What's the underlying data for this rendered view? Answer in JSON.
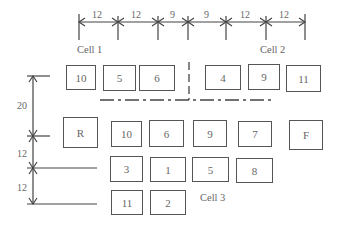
{
  "top_dimensions": {
    "ticks_x": [
      79,
      118,
      158,
      188,
      226,
      266,
      305
    ],
    "labels": [
      {
        "text": "12",
        "x": 92
      },
      {
        "text": "12",
        "x": 131
      },
      {
        "text": "9",
        "x": 170
      },
      {
        "text": "9",
        "x": 204
      },
      {
        "text": "12",
        "x": 240
      },
      {
        "text": "12",
        "x": 279
      }
    ]
  },
  "left_dimensions": {
    "ticks_y": [
      76,
      136,
      168,
      204
    ],
    "labels": [
      {
        "text": "20",
        "y": 100
      },
      {
        "text": "12",
        "y": 148
      },
      {
        "text": "12",
        "y": 182
      }
    ]
  },
  "cell_labels": {
    "cell1": "Cell 1",
    "cell2": "Cell 2",
    "cell3": "Cell 3"
  },
  "rows": {
    "row1": [
      {
        "label": "10",
        "x": 66,
        "y": 65,
        "w": 30,
        "h": 25
      },
      {
        "label": "5",
        "x": 103,
        "y": 65,
        "w": 33,
        "h": 26
      },
      {
        "label": "6",
        "x": 139,
        "y": 65,
        "w": 36,
        "h": 26
      },
      {
        "label": "4",
        "x": 205,
        "y": 65,
        "w": 36,
        "h": 25
      },
      {
        "label": "9",
        "x": 248,
        "y": 64,
        "w": 32,
        "h": 26
      },
      {
        "label": "11",
        "x": 286,
        "y": 65,
        "w": 35,
        "h": 27
      }
    ],
    "row2": [
      {
        "label": "R",
        "x": 63,
        "y": 117,
        "w": 35,
        "h": 31
      },
      {
        "label": "10",
        "x": 111,
        "y": 121,
        "w": 31,
        "h": 26
      },
      {
        "label": "6",
        "x": 149,
        "y": 120,
        "w": 35,
        "h": 27
      },
      {
        "label": "9",
        "x": 193,
        "y": 120,
        "w": 34,
        "h": 27
      },
      {
        "label": "7",
        "x": 238,
        "y": 121,
        "w": 34,
        "h": 26
      },
      {
        "label": "F",
        "x": 289,
        "y": 120,
        "w": 34,
        "h": 30
      }
    ],
    "row3": [
      {
        "label": "3",
        "x": 110,
        "y": 156,
        "w": 33,
        "h": 26
      },
      {
        "label": "1",
        "x": 150,
        "y": 157,
        "w": 36,
        "h": 25
      },
      {
        "label": "5",
        "x": 192,
        "y": 157,
        "w": 37,
        "h": 25
      },
      {
        "label": "8",
        "x": 236,
        "y": 158,
        "w": 37,
        "h": 25
      }
    ],
    "row4": [
      {
        "label": "11",
        "x": 111,
        "y": 190,
        "w": 32,
        "h": 25
      },
      {
        "label": "2",
        "x": 150,
        "y": 190,
        "w": 36,
        "h": 25
      }
    ]
  }
}
